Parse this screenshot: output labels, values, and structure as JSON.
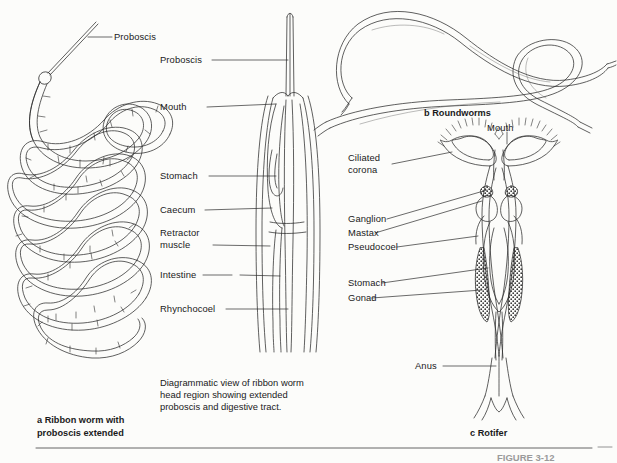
{
  "figure": {
    "number_label": "FIGURE 3-12",
    "panels": [
      {
        "id": "a",
        "caption_line1": "a Ribbon worm with",
        "caption_line2": "proboscis extended",
        "labels": [
          "Proboscis"
        ]
      },
      {
        "id": "head-diagram",
        "caption_line1": "Diagrammatic view of ribbon worm",
        "caption_line2": "head region showing extended",
        "caption_line3": "proboscis and digestive tract.",
        "labels": [
          "Proboscis",
          "Mouth",
          "Stomach",
          "Caecum",
          "Retractor",
          "muscle",
          "Intestine",
          "Rhynchocoel"
        ]
      },
      {
        "id": "b",
        "caption": "b Roundworms",
        "labels": []
      },
      {
        "id": "c",
        "caption": "c Rotifer",
        "labels": [
          "Mouth",
          "Ciliated",
          "corona",
          "Ganglion",
          "Mastax",
          "Pseudocoel",
          "Stomach",
          "Gonad",
          "Anus"
        ]
      }
    ]
  },
  "labels": {
    "a_proboscis": "Proboscis",
    "hd_proboscis": "Proboscis",
    "hd_mouth": "Mouth",
    "hd_stomach": "Stomach",
    "hd_caecum": "Caecum",
    "hd_retractor1": "Retractor",
    "hd_retractor2": "muscle",
    "hd_intestine": "Intestine",
    "hd_rhynchocoel": "Rhynchocoel",
    "rot_mouth": "Mouth",
    "rot_ciliated1": "Ciliated",
    "rot_ciliated2": "corona",
    "rot_ganglion": "Ganglion",
    "rot_mastax": "Mastax",
    "rot_pseudocoel": "Pseudocoel",
    "rot_stomach": "Stomach",
    "rot_gonad": "Gonad",
    "rot_anus": "Anus"
  },
  "captions": {
    "a_line1": "a Ribbon worm with",
    "a_line2": "proboscis extended",
    "hd_line1": "Diagrammatic view of ribbon worm",
    "hd_line2": "head region showing extended",
    "hd_line3": "proboscis and digestive tract.",
    "b": "b Roundworms",
    "c": "c Rotifer",
    "figure_number": "FIGURE 3-12"
  },
  "colors": {
    "ink": "#1a1a1a",
    "line": "#2b2b2b",
    "paper": "#fcfcfa",
    "rule": "#555555",
    "faded": "#b8b8b8"
  }
}
